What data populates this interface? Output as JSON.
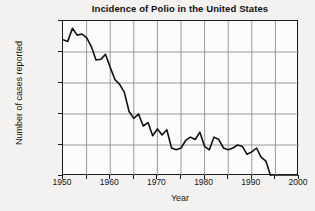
{
  "chart_data": {
    "type": "line",
    "title": "Incidence of Polio in the United States",
    "xlabel": "Year",
    "ylabel": "Number of cases reported",
    "yscale": "log",
    "xlim": [
      1950,
      2000
    ],
    "ylim": [
      1,
      100000
    ],
    "grid": true,
    "legend": null,
    "xticks": [
      1950,
      1960,
      1970,
      1980,
      1990,
      2000
    ],
    "xtick_labels": [
      "1950",
      "1960",
      "1970",
      "1980",
      "1990",
      "2000"
    ],
    "xminor_step": 5,
    "yticks": [
      1,
      10,
      100,
      1000,
      10000,
      100000
    ],
    "ytick_labels": [
      "1",
      "10",
      "100",
      "1000",
      "10 000",
      "100 000"
    ],
    "series": [
      {
        "name": "Reported polio cases",
        "color": "#111111",
        "x": [
          1950,
          1951,
          1952,
          1953,
          1954,
          1955,
          1956,
          1957,
          1958,
          1959,
          1960,
          1961,
          1962,
          1963,
          1964,
          1965,
          1966,
          1967,
          1968,
          1969,
          1970,
          1971,
          1972,
          1973,
          1974,
          1975,
          1976,
          1977,
          1978,
          1979,
          1980,
          1981,
          1982,
          1983,
          1984,
          1985,
          1986,
          1987,
          1988,
          1989,
          1990,
          1991,
          1992,
          1993,
          1994,
          1995,
          1996,
          1997,
          1998,
          1999,
          2000
        ],
        "y": [
          25000,
          22000,
          58000,
          35000,
          38000,
          29000,
          15000,
          5500,
          5800,
          8400,
          3200,
          1300,
          900,
          500,
          120,
          72,
          100,
          41,
          53,
          20,
          33,
          21,
          31,
          8,
          7,
          8,
          14,
          18,
          15,
          26,
          9,
          7,
          18,
          15,
          8,
          7,
          8,
          10,
          9,
          5,
          6,
          8,
          4,
          3,
          1,
          1,
          1,
          1,
          1,
          1,
          1
        ]
      }
    ],
    "annotations": []
  },
  "colors": {
    "line": "#111111",
    "grid": "#8e8e8e",
    "frame": "#1a1a1a",
    "plot_background": "#fbfbfa",
    "page_background": "#f3f2f0",
    "text": "#141414"
  }
}
